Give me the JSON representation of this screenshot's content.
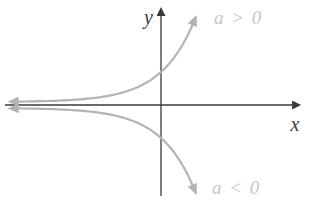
{
  "figure": {
    "background_color": "#ffffff",
    "axes": {
      "color": "#3a3a3a",
      "x_label": "x",
      "y_label": "y",
      "stroke_width": 1.3
    },
    "curves": {
      "color": "#b3b3b3",
      "stroke_width": 2.2,
      "label_color": "#c5c5c5",
      "positive": {
        "label": "a > 0"
      },
      "negative": {
        "label": "a < 0"
      }
    },
    "geometry": {
      "width": 320,
      "height": 209,
      "origin": {
        "x": 161,
        "y": 105
      },
      "x_axis": {
        "x1": 5,
        "x2": 293
      },
      "y_axis": {
        "y1": 196,
        "y2": 15
      },
      "curve": {
        "base_offset": 3,
        "amplitude": 30,
        "k": 0.03,
        "x_start": 17,
        "x_end": 193,
        "step": 2
      }
    }
  }
}
